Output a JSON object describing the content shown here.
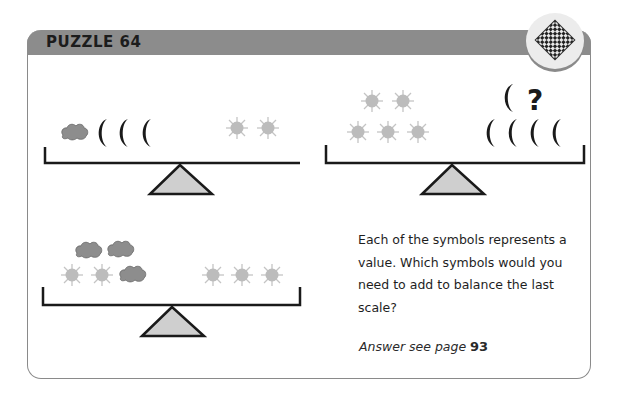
{
  "header": {
    "title": "PUZZLE 64",
    "badge_icon": "chessboard-icon",
    "header_color": "#8c8c8c"
  },
  "scales": [
    {
      "id": 1,
      "left_pan": [
        "cloud",
        "moon",
        "moon",
        "moon"
      ],
      "right_pan": [
        "sun",
        "sun"
      ],
      "balanced": true
    },
    {
      "id": 2,
      "left_pan": [
        "sun",
        "sun",
        "sun",
        "sun",
        "sun"
      ],
      "right_pan": [
        "moon",
        "moon",
        "moon",
        "moon",
        "moon",
        "?"
      ],
      "balanced": true
    },
    {
      "id": 3,
      "left_pan": [
        "cloud",
        "cloud",
        "sun",
        "sun",
        "cloud"
      ],
      "right_pan": [
        "sun",
        "sun",
        "sun"
      ],
      "balanced": false
    }
  ],
  "question_mark": "?",
  "prompt": {
    "text": "Each of the symbols represents a value. Which symbols would you need to add to balance the last scale?"
  },
  "answer": {
    "prefix": "Answer see page ",
    "page": "93"
  },
  "colors": {
    "sun": "#bdbdbd",
    "cloud": "#8a8a8a",
    "moon": "#1a1a1a",
    "fulcrum": "#cfcfcf",
    "beam": "#1a1a1a"
  }
}
